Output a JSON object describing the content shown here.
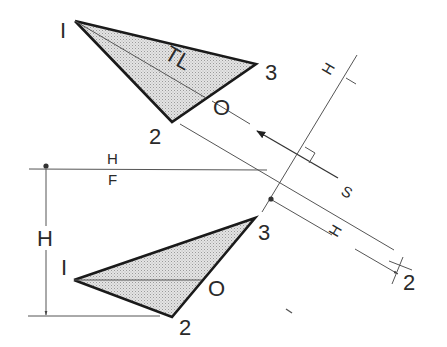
{
  "diagram": {
    "title": "",
    "colors": {
      "background": "#ffffff",
      "line": "#1a1a1a",
      "thin_line": "#555555",
      "shade": "#d6d6d6"
    },
    "top_view": {
      "points": {
        "p1": {
          "label": "I",
          "x": 75,
          "y": 21
        },
        "p2": {
          "label": "2",
          "x": 172,
          "y": 122
        },
        "p3": {
          "label": "3",
          "x": 256,
          "y": 64
        },
        "pO": {
          "label": "O",
          "x": 206,
          "y": 98
        }
      },
      "true_length_label": "TL"
    },
    "front_view": {
      "points": {
        "p1": {
          "label": "I",
          "x": 74,
          "y": 280
        },
        "p2": {
          "label": "2",
          "x": 172,
          "y": 317
        },
        "p3": {
          "label": "3",
          "x": 255,
          "y": 218
        },
        "pO": {
          "label": "O",
          "x": 201,
          "y": 280
        }
      }
    },
    "fold_line_HF": {
      "upper_label": "H",
      "lower_label": "F"
    },
    "fold_line_H1": {
      "upper_label": "H",
      "lower_label": "I"
    },
    "sight_line": {
      "label": "S"
    },
    "dimension_front": {
      "label": "H"
    },
    "dimension_aux": {
      "label": "H"
    },
    "aux_point_label": "2"
  }
}
